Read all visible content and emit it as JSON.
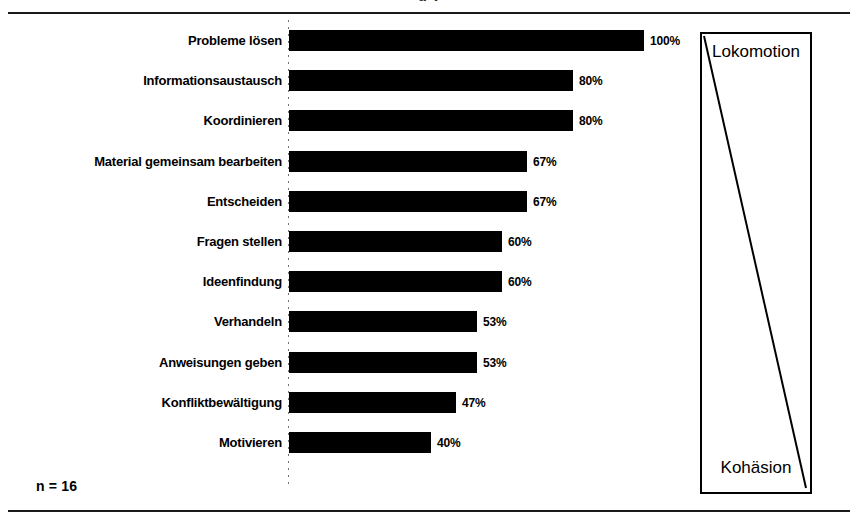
{
  "figure": {
    "clipped_heading": "g                                        y",
    "sample_note": "n = 16"
  },
  "continuum": {
    "top_label": "Lokomotion",
    "bottom_label": "Kohäsion"
  },
  "chart_data": {
    "type": "bar",
    "orientation": "horizontal",
    "title": "",
    "subtitle": "",
    "xlabel": "",
    "ylabel": "",
    "xlim": [
      0,
      100
    ],
    "grid": false,
    "legend": null,
    "value_suffix": "%",
    "annotations": [
      "n = 16"
    ],
    "categories": [
      "Probleme lösen",
      "Informationsaustausch",
      "Koordinieren",
      "Material gemeinsam bearbeiten",
      "Entscheiden",
      "Fragen stellen",
      "Ideenfindung",
      "Verhandeln",
      "Anweisungen geben",
      "Konfliktbewältigung",
      "Motivieren"
    ],
    "values": [
      100,
      80,
      80,
      67,
      67,
      60,
      60,
      53,
      53,
      47,
      40
    ],
    "value_labels": [
      "100%",
      "80%",
      "80%",
      "67%",
      "67%",
      "60%",
      "60%",
      "53%",
      "53%",
      "47%",
      "40%"
    ],
    "bars": [
      {
        "label": "Probleme lösen",
        "value": 100,
        "value_label": "100%"
      },
      {
        "label": "Informationsaustausch",
        "value": 80,
        "value_label": "80%"
      },
      {
        "label": "Koordinieren",
        "value": 80,
        "value_label": "80%"
      },
      {
        "label": "Material gemeinsam bearbeiten",
        "value": 67,
        "value_label": "67%"
      },
      {
        "label": "Entscheiden",
        "value": 67,
        "value_label": "67%"
      },
      {
        "label": "Fragen stellen",
        "value": 60,
        "value_label": "60%"
      },
      {
        "label": "Ideenfindung",
        "value": 60,
        "value_label": "60%"
      },
      {
        "label": "Verhandeln",
        "value": 53,
        "value_label": "53%"
      },
      {
        "label": "Anweisungen geben",
        "value": 53,
        "value_label": "53%"
      },
      {
        "label": "Konfliktbewältigung",
        "value": 47,
        "value_label": "47%"
      },
      {
        "label": "Motivieren",
        "value": 40,
        "value_label": "40%"
      }
    ],
    "colors": {
      "bar": "#000000",
      "background": "#ffffff",
      "text": "#000000",
      "axis": "#5a5a5a"
    }
  }
}
